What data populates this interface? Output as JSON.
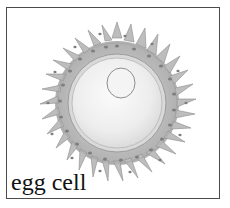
{
  "figure": {
    "label": "egg cell",
    "colors": {
      "frame_border": "#4a4a4a",
      "follicle_cells": "#b8b8b8",
      "follicle_cell_edge": "#8a8a8a",
      "follicle_nucleus": "#7a7a7a",
      "zona": "#d8d8d8",
      "cytoplasm": "#f2f2f2",
      "nucleus_edge": "#9a9a9a",
      "label_text": "#111111"
    }
  }
}
